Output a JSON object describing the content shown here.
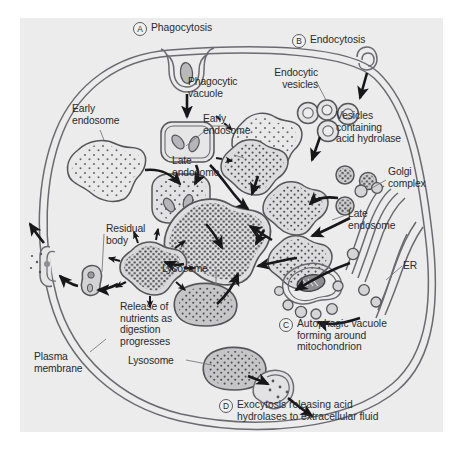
{
  "figure": {
    "background_color": "#ececed",
    "ink_color": "#55555a",
    "text_color": "#2a2a2c",
    "organelle_fill": "#d7d7d8",
    "vesicle_fill": "#c9c9cb"
  },
  "stages": [
    {
      "key": "A",
      "letter": "A",
      "label": "Phagocytosis",
      "x": 110,
      "y": 4
    },
    {
      "key": "B",
      "letter": "B",
      "label": "Endocytosis",
      "x": 275,
      "y": 16
    },
    {
      "key": "C",
      "letter": "C",
      "label": "Autophagic vacuole\nforming around\nmitochondrion",
      "x": 283,
      "y": 292
    },
    {
      "key": "D",
      "letter": "D",
      "label": "Exocytosis releasing acid\nhydrolases to extracellular fluid",
      "x": 216,
      "y": 398
    }
  ],
  "labels": [
    {
      "key": "phagocytic_vacuole",
      "text": "Phagocytic\nvacuole",
      "x": 168,
      "y": 58
    },
    {
      "key": "early_endosome_left",
      "text": "Early\nendosome",
      "x": 52,
      "y": 85
    },
    {
      "key": "early_endosome_right",
      "text": "Early\nendosome",
      "x": 183,
      "y": 95
    },
    {
      "key": "endocytic_vesicles",
      "text": "Endocytic\nvesicles",
      "x": 256,
      "y": 49
    },
    {
      "key": "vesicles_acid_hydrolase",
      "text": "Vesicles\ncontaining\nacid hydrolase",
      "x": 316,
      "y": 92
    },
    {
      "key": "golgi_complex",
      "text": "Golgi\ncomplex",
      "x": 366,
      "y": 148
    },
    {
      "key": "late_endosome_left",
      "text": "Late\nendosome",
      "x": 195,
      "y": 137
    },
    {
      "key": "late_endosome_right",
      "text": "Late\nendosome",
      "x": 300,
      "y": 185
    },
    {
      "key": "er",
      "text": "ER",
      "x": 382,
      "y": 240
    },
    {
      "key": "residual_body",
      "text": "Residual\nbody",
      "x": 56,
      "y": 205
    },
    {
      "key": "release_nutrients",
      "text": "Release of\nnutrients as\ndigestion\nprogresses",
      "x": 88,
      "y": 258
    },
    {
      "key": "lysosome_center",
      "text": "Lysosome",
      "x": 160,
      "y": 244
    },
    {
      "key": "lysosome_bottom",
      "text": "Lysosome",
      "x": 128,
      "y": 337
    },
    {
      "key": "plasma_membrane",
      "text": "Plasma\nmembrane",
      "x": 34,
      "y": 332
    }
  ]
}
